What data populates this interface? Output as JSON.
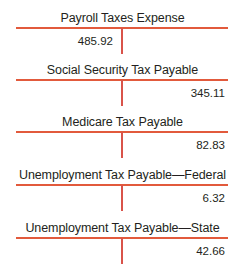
{
  "accounts": [
    {
      "name": "Payroll Taxes Expense",
      "debit": "485.92",
      "credit": ""
    },
    {
      "name": "Social Security Tax Payable",
      "debit": "",
      "credit": "345.11"
    },
    {
      "name": "Medicare Tax Payable",
      "debit": "",
      "credit": "82.83"
    },
    {
      "name": "Unemployment Tax Payable—Federal",
      "debit": "",
      "credit": "6.32"
    },
    {
      "name": "Unemployment Tax Payable—State",
      "debit": "",
      "credit": "42.66"
    }
  ],
  "colors": {
    "rule": "#e25a3c",
    "text": "#231f20"
  }
}
